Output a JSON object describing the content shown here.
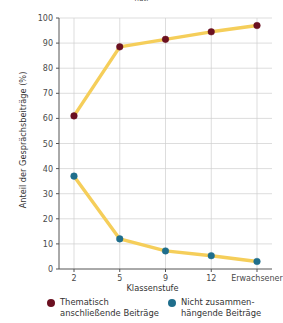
{
  "figure": {
    "clipped_top_text": "nut.",
    "background_color": "#ffffff"
  },
  "chart_data": {
    "type": "line",
    "title": "",
    "xlabel": "Klassenstufe",
    "ylabel": "Anteil der Gesprächsbeiträge (%)",
    "categories": [
      "2",
      "5",
      "9",
      "12",
      "Erwachsener"
    ],
    "xtick_labels": [
      "2",
      "5",
      "9",
      "12",
      "Erwachsener"
    ],
    "ytick_labels": [
      "0",
      "10",
      "20",
      "30",
      "40",
      "50",
      "60",
      "70",
      "80",
      "90",
      "100"
    ],
    "yticks": [
      0,
      10,
      20,
      30,
      40,
      50,
      60,
      70,
      80,
      90,
      100
    ],
    "ylim": [
      0,
      100
    ],
    "grid": true,
    "legend_position": "bottom",
    "line_color": "#F5CE5A",
    "series": [
      {
        "name": "Thematisch anschließende Beiträge",
        "legend_label": "Thematisch\nanschließende Beiträge",
        "color": "#6B1020",
        "values": [
          61,
          88.5,
          91.5,
          94.5,
          97
        ]
      },
      {
        "name": "Nicht zusammenhängende Beiträge",
        "legend_label": "Nicht zusammen-\nhängende Beiträge",
        "color": "#1F6E8C",
        "values": [
          37,
          12,
          7.2,
          5.3,
          3
        ]
      }
    ]
  }
}
